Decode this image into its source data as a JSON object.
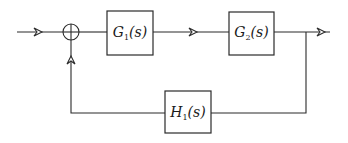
{
  "diagram": {
    "type": "feedback block diagram",
    "blocks": [
      {
        "id": "G1",
        "name": "G",
        "subscript": "1",
        "arg": "(s)",
        "role": "forward"
      },
      {
        "id": "G2",
        "name": "G",
        "subscript": "2",
        "arg": "(s)",
        "role": "forward"
      },
      {
        "id": "H1",
        "name": "H",
        "subscript": "1",
        "arg": "(s)",
        "role": "feedback"
      }
    ],
    "summing_junction": {
      "id": "sum1",
      "symbol": "circle-cross"
    },
    "connections": [
      {
        "from": "input",
        "to": "sum1"
      },
      {
        "from": "sum1",
        "to": "G1"
      },
      {
        "from": "G1",
        "to": "G2"
      },
      {
        "from": "G2",
        "to": "output"
      },
      {
        "from": "G2",
        "to": "H1",
        "via": "branch point"
      },
      {
        "from": "H1",
        "to": "sum1"
      }
    ],
    "stroke_color": "#2a2a2a",
    "background_color": "#ffffff"
  }
}
